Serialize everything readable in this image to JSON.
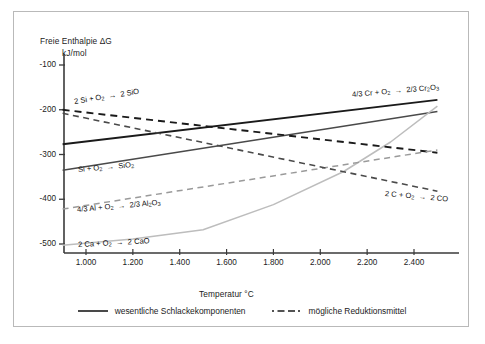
{
  "chart_data": {
    "type": "line",
    "title": "",
    "xlabel": "Temperatur  °C",
    "ylabel_main": "Freie Enthalpie ΔG",
    "ylabel_unit": "kJ/mol",
    "xlim": [
      900,
      2500
    ],
    "ylim": [
      -540,
      -90
    ],
    "xticks": [
      1000,
      1200,
      1400,
      1600,
      1800,
      2000,
      2200,
      2400
    ],
    "xtick_labels": [
      "1.000",
      "1.200",
      "1.400",
      "1.600",
      "1.800",
      "2.000",
      "2.200",
      "2.400"
    ],
    "yticks": [
      -100,
      -200,
      -300,
      -400,
      -500
    ],
    "ytick_labels": [
      "-100",
      "-200",
      "-300",
      "-400",
      "-500"
    ],
    "grid": false,
    "legend_position": "below-axes",
    "series": [
      {
        "name": "4/3 Cr + O2 -> 2/3 Cr2O3",
        "label": "4/3 Cr + O₂ → 2/3 Cr₂O₃",
        "style": "solid",
        "color": "#1a1a1a",
        "width": 1.9,
        "points": [
          [
            900,
            -277
          ],
          [
            2500,
            -178
          ]
        ]
      },
      {
        "name": "Si + O2 -> SiO2",
        "label": "Si + O₂ → SiO₂",
        "style": "solid",
        "color": "#4a4a4a",
        "width": 1.5,
        "points": [
          [
            900,
            -335
          ],
          [
            2500,
            -204
          ]
        ]
      },
      {
        "name": "2 Ca + O2 -> 2 CaO",
        "label": "2 Ca + O₂ → 2 CaO",
        "style": "solid",
        "color": "#bdbdbd",
        "width": 1.5,
        "points": [
          [
            900,
            -503
          ],
          [
            1200,
            -489
          ],
          [
            1500,
            -468
          ],
          [
            1800,
            -412
          ],
          [
            2100,
            -338
          ],
          [
            2300,
            -272
          ],
          [
            2500,
            -192
          ]
        ]
      },
      {
        "name": "2 Si + O2 -> 2 SiO",
        "label": "2 Si + O₂ → 2 SiO",
        "style": "dashed",
        "color": "#1a1a1a",
        "width": 1.9,
        "points": [
          [
            900,
            -200
          ],
          [
            2500,
            -296
          ]
        ]
      },
      {
        "name": "4/3 Al + O2 -> 2/3 Al2O3",
        "label": "4/3 Al + O₂ → 2/3 Al₂O₃",
        "style": "dashed",
        "color": "#9a9a9a",
        "width": 1.5,
        "points": [
          [
            900,
            -422
          ],
          [
            2500,
            -290
          ]
        ]
      },
      {
        "name": "2 C + O2 -> 2 CO",
        "label": "2 C + O₂ → 2 CO",
        "style": "dashed",
        "color": "#4a4a4a",
        "width": 1.6,
        "points": [
          [
            900,
            -208
          ],
          [
            2500,
            -382
          ]
        ]
      }
    ],
    "annotations": [
      {
        "id": "label-sio",
        "text_html": "2 Si + O<sub>2</sub> &nbsp;→&nbsp; 2 SiO",
        "x": 60,
        "y": 85,
        "rotate": -9
      },
      {
        "id": "label-sio2",
        "text_html": "Si + O<sub>2</sub> &nbsp;→&nbsp; SiO<sub>2</sub>",
        "x": 64,
        "y": 153,
        "rotate": -5
      },
      {
        "id": "label-al2o3",
        "text_html": "4/3 Al + O<sub>2</sub> &nbsp;→&nbsp; 2/3 Al<sub>2</sub>O<sub>3</sub>",
        "x": 63,
        "y": 193,
        "rotate": -5
      },
      {
        "id": "label-cao",
        "text_html": "2 Ca + O<sub>2</sub> &nbsp;→&nbsp; 2 CaO",
        "x": 64,
        "y": 228,
        "rotate": -3
      },
      {
        "id": "label-cr2o3",
        "text_html": "4/3 Cr + O<sub>2</sub> &nbsp;→&nbsp; 2/3 Cr<sub>2</sub>O<sub>3</sub>",
        "x": 338,
        "y": 78,
        "rotate": -5
      },
      {
        "id": "label-co",
        "text_html": "2 C + O<sub>2</sub> &nbsp;→&nbsp; 2 CO",
        "x": 371,
        "y": 177,
        "rotate": 5
      }
    ]
  },
  "legend": {
    "items": [
      {
        "label": "wesentliche Schlackekomponenten",
        "style": "solid"
      },
      {
        "label": "mögliche Reduktionsmittel",
        "style": "dashed"
      }
    ]
  }
}
